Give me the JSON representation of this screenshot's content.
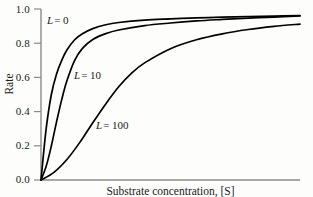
{
  "chart_data": {
    "type": "line",
    "title": "",
    "xlabel": "Substrate concentration, [S]",
    "ylabel": "Rate",
    "ylim": [
      0,
      1.0
    ],
    "xlim": [
      0,
      100
    ],
    "grid": false,
    "legend_position": "inline-curve-labels",
    "y_ticks": [
      "0.0",
      "0.2",
      "0.4",
      "0.6",
      "0.8",
      "1.0"
    ],
    "y_tick_values": [
      0.0,
      0.2,
      0.4,
      0.6,
      0.8,
      1.0
    ],
    "x_ticks": [],
    "series": [
      {
        "name": "L = 0",
        "label_L": "L",
        "label_eq": "=",
        "label_value": "0",
        "x": [
          0,
          2,
          4,
          6,
          8,
          10,
          13,
          16,
          20,
          25,
          30,
          40,
          50,
          60,
          70,
          80,
          90,
          100
        ],
        "values": [
          0.0,
          0.3,
          0.5,
          0.62,
          0.7,
          0.76,
          0.82,
          0.855,
          0.885,
          0.908,
          0.921,
          0.935,
          0.942,
          0.948,
          0.952,
          0.956,
          0.958,
          0.962
        ]
      },
      {
        "name": "L = 10",
        "label_L": "L",
        "label_eq": "=",
        "label_value": "10",
        "x": [
          0,
          2,
          4,
          6,
          8,
          10,
          13,
          16,
          20,
          25,
          30,
          40,
          50,
          60,
          70,
          80,
          90,
          100
        ],
        "values": [
          0.0,
          0.08,
          0.2,
          0.34,
          0.47,
          0.58,
          0.7,
          0.77,
          0.822,
          0.856,
          0.877,
          0.903,
          0.918,
          0.93,
          0.939,
          0.947,
          0.953,
          0.959
        ]
      },
      {
        "name": "L = 100",
        "label_L": "L",
        "label_eq": "=",
        "label_value": "100",
        "x": [
          0,
          5,
          10,
          15,
          20,
          25,
          30,
          35,
          40,
          50,
          60,
          70,
          80,
          90,
          100
        ],
        "values": [
          0.0,
          0.045,
          0.12,
          0.22,
          0.335,
          0.445,
          0.545,
          0.625,
          0.685,
          0.768,
          0.82,
          0.855,
          0.88,
          0.898,
          0.912
        ]
      }
    ],
    "colors": {
      "curve": "#000000",
      "axis": "#8a8a8a",
      "text": "#1a1a1a",
      "background": "#fdfdfc"
    }
  },
  "axes": {
    "y_label": "Rate",
    "x_label": "Substrate concentration, [S]",
    "tick_0": "0.0",
    "tick_1": "0.2",
    "tick_2": "0.4",
    "tick_3": "0.6",
    "tick_4": "0.8",
    "tick_5": "1.0"
  },
  "annotations": {
    "curve_0": {
      "var": "L",
      "eq": "=",
      "val": "0"
    },
    "curve_1": {
      "var": "L",
      "eq": "=",
      "val": "10"
    },
    "curve_2": {
      "var": "L",
      "eq": "=",
      "val": "100"
    }
  }
}
